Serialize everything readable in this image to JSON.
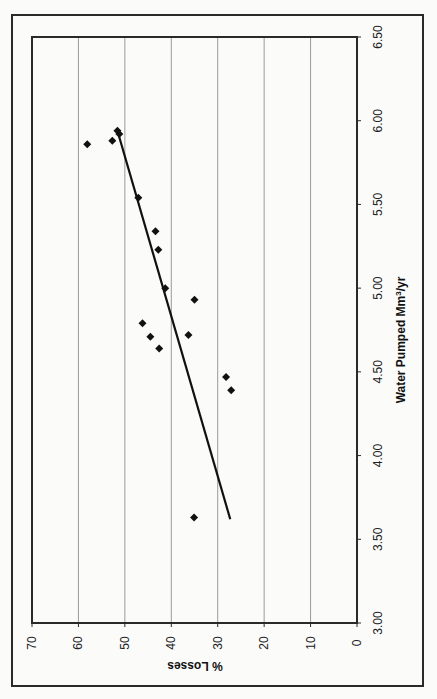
{
  "chart_data": {
    "type": "scatter",
    "title": "",
    "xlabel": "Water Pumped Mm³/yr",
    "xlabel_parts": {
      "main": "Water Pumped Mm",
      "sup": "3",
      "tail": "/yr"
    },
    "ylabel": "% Losses",
    "xlim": [
      3.0,
      6.5
    ],
    "ylim": [
      0,
      70
    ],
    "x_ticks": [
      "3.00",
      "3.50",
      "4.00",
      "4.50",
      "5.00",
      "5.50",
      "6.00",
      "6.50"
    ],
    "y_ticks": [
      "0",
      "10",
      "20",
      "30",
      "40",
      "50",
      "60",
      "70"
    ],
    "grid": {
      "y_major": true,
      "x_major": false
    },
    "orientation_note": "figure rotated 90 degrees: water pumped axis runs vertically on right, % losses axis horizontally at bottom",
    "legend": null,
    "series": [
      {
        "name": "Observed",
        "marker": "diamond",
        "color": "#111111",
        "points": [
          {
            "x": 5.86,
            "y": 58.1
          },
          {
            "x": 5.88,
            "y": 52.7
          },
          {
            "x": 5.94,
            "y": 51.6
          },
          {
            "x": 5.92,
            "y": 51.2
          },
          {
            "x": 5.54,
            "y": 47.1
          },
          {
            "x": 5.34,
            "y": 43.4
          },
          {
            "x": 5.23,
            "y": 42.8
          },
          {
            "x": 5.0,
            "y": 41.3
          },
          {
            "x": 4.93,
            "y": 35.0
          },
          {
            "x": 4.79,
            "y": 46.2
          },
          {
            "x": 4.71,
            "y": 44.5
          },
          {
            "x": 4.64,
            "y": 42.6
          },
          {
            "x": 4.72,
            "y": 36.3
          },
          {
            "x": 4.47,
            "y": 28.2
          },
          {
            "x": 4.39,
            "y": 27.1
          },
          {
            "x": 3.63,
            "y": 35.1
          }
        ]
      },
      {
        "name": "Linear trend",
        "type": "line",
        "color": "#111111",
        "points": [
          {
            "x": 5.94,
            "y": 51.6
          },
          {
            "x": 3.62,
            "y": 27.3
          }
        ]
      }
    ]
  }
}
